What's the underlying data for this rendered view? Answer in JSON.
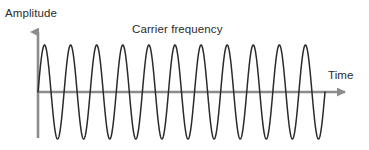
{
  "figure": {
    "background_color": "#ffffff",
    "width": 369,
    "height": 150
  },
  "labels": {
    "y_axis": "Amplitude",
    "x_axis": "Time",
    "annotation": "Carrier frequency"
  },
  "style": {
    "axis_color": "#8c8c8c",
    "wave_color": "#2a2a2a",
    "text_color": "#2b2b2b",
    "axis_stroke_width": 2.6,
    "wave_stroke_width": 1.5
  },
  "chart_data": {
    "type": "line",
    "title": "",
    "subtitle": "",
    "xlabel": "Time",
    "ylabel": "Amplitude",
    "annotations": [
      "Carrier frequency"
    ],
    "grid": false,
    "legend": false,
    "legend_position": "none",
    "tick_labels_x": [],
    "tick_labels_y": [],
    "xlim": [
      0,
      11
    ],
    "ylim": [
      -1,
      1
    ],
    "series": [
      {
        "name": "Carrier frequency",
        "waveform": "sine",
        "cycles": 11,
        "amplitude": 1,
        "phase": 0,
        "offset": 0,
        "description": "Constant-amplitude unmodulated sinusoidal carrier wave"
      }
    ],
    "geometry": {
      "origin_x_px": 38,
      "baseline_y_px": 92,
      "wave_start_x_px": 38,
      "wave_end_x_px": 325,
      "period_px": 26.1,
      "peak_y_px": 45,
      "trough_y_px": 139,
      "y_axis_top_px": 28,
      "y_axis_bottom_px": 138,
      "x_axis_end_px": 352
    }
  }
}
